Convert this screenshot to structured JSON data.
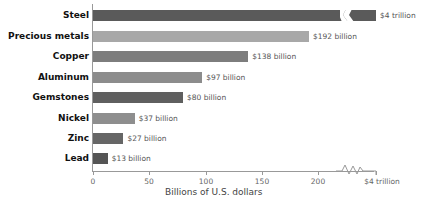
{
  "chart_data": {
    "type": "bar",
    "orientation": "horizontal",
    "title": "",
    "xlabel": "Billions of U.S. dollars",
    "ylabel": "",
    "categories": [
      "Steel",
      "Precious metals",
      "Copper",
      "Aluminum",
      "Gemstones",
      "Nickel",
      "Zinc",
      "Lead"
    ],
    "values": [
      4000,
      192,
      138,
      97,
      80,
      37,
      27,
      13
    ],
    "value_labels": [
      "$4 trillion",
      "$192 billion",
      "$138 billion",
      "$97 billion",
      "$80 billion",
      "$37 billion",
      "$27 billion",
      "$13 billion"
    ],
    "colors": [
      "#5a5a5a",
      "#a8a8a8",
      "#7d7d7d",
      "#8c8c8c",
      "#5f5f5f",
      "#8e8e8e",
      "#666666",
      "#555555"
    ],
    "xticks": [
      "0",
      "50",
      "100",
      "150",
      "200",
      "$4 trillion"
    ],
    "xlim": [
      0,
      240
    ],
    "axis_break": true,
    "grid": false,
    "legend": null
  }
}
